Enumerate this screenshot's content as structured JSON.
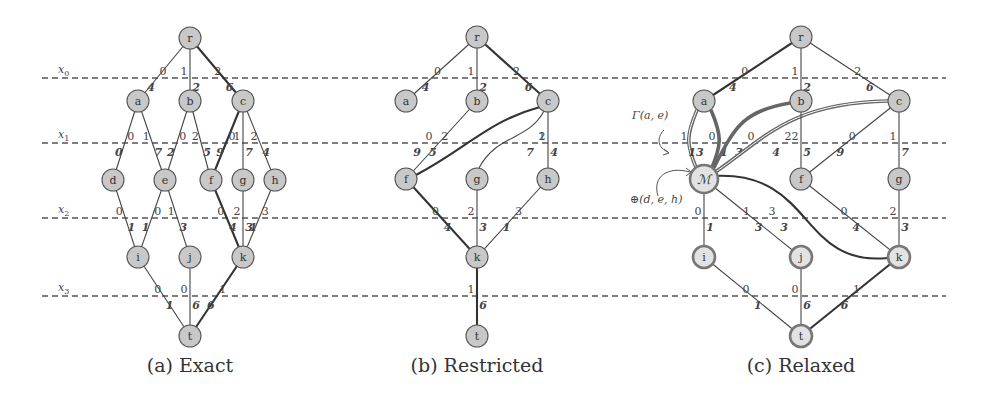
{
  "figure": {
    "layer_lines": {
      "x_start": 42,
      "x_end": 946,
      "rows": [
        {
          "label": "x0",
          "y": 78
        },
        {
          "label": "x1",
          "y": 143
        },
        {
          "label": "x2",
          "y": 218
        },
        {
          "label": "x3",
          "y": 296
        }
      ]
    },
    "node_radius": 11,
    "panels": [
      {
        "id": "a",
        "caption": "(a) Exact",
        "caption_x": 190,
        "nodes": [
          {
            "id": "r",
            "label": "r",
            "x": 190,
            "y": 38
          },
          {
            "id": "a",
            "label": "a",
            "x": 138,
            "y": 101
          },
          {
            "id": "b",
            "label": "b",
            "x": 190,
            "y": 101
          },
          {
            "id": "c",
            "label": "c",
            "x": 243,
            "y": 101
          },
          {
            "id": "d",
            "label": "d",
            "x": 113,
            "y": 180
          },
          {
            "id": "e",
            "label": "e",
            "x": 165,
            "y": 180
          },
          {
            "id": "f",
            "label": "f",
            "x": 211,
            "y": 180
          },
          {
            "id": "g",
            "label": "g",
            "x": 243,
            "y": 180
          },
          {
            "id": "h",
            "label": "h",
            "x": 275,
            "y": 180
          },
          {
            "id": "i",
            "label": "i",
            "x": 138,
            "y": 257
          },
          {
            "id": "j",
            "label": "j",
            "x": 190,
            "y": 257
          },
          {
            "id": "k",
            "label": "k",
            "x": 243,
            "y": 257
          },
          {
            "id": "t",
            "label": "t",
            "x": 190,
            "y": 336
          }
        ],
        "edges": [
          {
            "from": "r",
            "to": "a",
            "value": "0",
            "weight": "4",
            "style": "normal"
          },
          {
            "from": "r",
            "to": "b",
            "value": "1",
            "weight": "2",
            "style": "normal"
          },
          {
            "from": "r",
            "to": "c",
            "value": "2",
            "weight": "6",
            "style": "bold"
          },
          {
            "from": "a",
            "to": "d",
            "value": "0",
            "weight": "0",
            "style": "normal"
          },
          {
            "from": "a",
            "to": "e",
            "value": "1",
            "weight": "7",
            "style": "normal"
          },
          {
            "from": "b",
            "to": "e",
            "value": "0",
            "weight": "2",
            "style": "normal"
          },
          {
            "from": "b",
            "to": "f",
            "value": "2",
            "weight": "5",
            "style": "normal"
          },
          {
            "from": "c",
            "to": "f",
            "value": "0",
            "weight": "9",
            "style": "bold"
          },
          {
            "from": "c",
            "to": "g",
            "value": "1",
            "weight": "7",
            "style": "normal"
          },
          {
            "from": "c",
            "to": "h",
            "value": "2",
            "weight": "4",
            "style": "normal"
          },
          {
            "from": "d",
            "to": "i",
            "value": "0",
            "weight": "1",
            "style": "normal"
          },
          {
            "from": "e",
            "to": "i",
            "value": "0",
            "weight": "1",
            "style": "normal"
          },
          {
            "from": "e",
            "to": "j",
            "value": "1",
            "weight": "3",
            "style": "normal"
          },
          {
            "from": "f",
            "to": "k",
            "value": "0",
            "weight": "4",
            "style": "bold"
          },
          {
            "from": "g",
            "to": "k",
            "value": "2",
            "weight": "3",
            "style": "normal"
          },
          {
            "from": "h",
            "to": "k",
            "value": "3",
            "weight": "1",
            "style": "normal"
          },
          {
            "from": "i",
            "to": "t",
            "value": "0",
            "weight": "1",
            "style": "normal"
          },
          {
            "from": "j",
            "to": "t",
            "value": "0",
            "weight": "6",
            "style": "normal"
          },
          {
            "from": "k",
            "to": "t",
            "value": "1",
            "weight": "6",
            "style": "bold"
          }
        ]
      },
      {
        "id": "b",
        "caption": "(b) Restricted",
        "caption_x": 477,
        "nodes": [
          {
            "id": "r",
            "label": "r",
            "x": 477,
            "y": 37
          },
          {
            "id": "a",
            "label": "a",
            "x": 406,
            "y": 101
          },
          {
            "id": "b",
            "label": "b",
            "x": 477,
            "y": 101
          },
          {
            "id": "c",
            "label": "c",
            "x": 548,
            "y": 101
          },
          {
            "id": "f",
            "label": "f",
            "x": 406,
            "y": 179
          },
          {
            "id": "g",
            "label": "g",
            "x": 477,
            "y": 179
          },
          {
            "id": "h",
            "label": "h",
            "x": 548,
            "y": 179
          },
          {
            "id": "k",
            "label": "k",
            "x": 477,
            "y": 257
          },
          {
            "id": "t",
            "label": "t",
            "x": 477,
            "y": 336
          }
        ],
        "edges": [
          {
            "from": "r",
            "to": "a",
            "value": "0",
            "weight": "4",
            "style": "normal"
          },
          {
            "from": "r",
            "to": "b",
            "value": "1",
            "weight": "2",
            "style": "normal"
          },
          {
            "from": "r",
            "to": "c",
            "value": "2",
            "weight": "6",
            "style": "bold"
          },
          {
            "from": "b",
            "to": "f",
            "value": "2",
            "weight": "5",
            "style": "normal"
          },
          {
            "from": "c",
            "to": "f",
            "value": "0",
            "weight": "9",
            "style": "bold",
            "curve": "s"
          },
          {
            "from": "c",
            "to": "g",
            "value": "1",
            "weight": "7",
            "style": "normal",
            "curve": "s"
          },
          {
            "from": "c",
            "to": "h",
            "value": "2",
            "weight": "4",
            "style": "normal"
          },
          {
            "from": "f",
            "to": "k",
            "value": "0",
            "weight": "4",
            "style": "bold"
          },
          {
            "from": "g",
            "to": "k",
            "value": "2",
            "weight": "3",
            "style": "normal"
          },
          {
            "from": "h",
            "to": "k",
            "value": "3",
            "weight": "1",
            "style": "normal"
          },
          {
            "from": "k",
            "to": "t",
            "value": "1",
            "weight": "6",
            "style": "bold"
          }
        ]
      },
      {
        "id": "c",
        "caption": "(c) Relaxed",
        "caption_x": 801,
        "nodes": [
          {
            "id": "r",
            "label": "r",
            "x": 801,
            "y": 37
          },
          {
            "id": "a",
            "label": "a",
            "x": 704,
            "y": 101
          },
          {
            "id": "b",
            "label": "b",
            "x": 801,
            "y": 101
          },
          {
            "id": "c",
            "label": "c",
            "x": 899,
            "y": 101
          },
          {
            "id": "M",
            "label": "ℳ",
            "x": 704,
            "y": 179,
            "ring": true,
            "big": true
          },
          {
            "id": "f",
            "label": "f",
            "x": 801,
            "y": 179
          },
          {
            "id": "g",
            "label": "g",
            "x": 899,
            "y": 179
          },
          {
            "id": "i",
            "label": "i",
            "x": 704,
            "y": 257,
            "ring": true
          },
          {
            "id": "j",
            "label": "j",
            "x": 801,
            "y": 257,
            "ring": true
          },
          {
            "id": "k",
            "label": "k",
            "x": 899,
            "y": 257,
            "ring": true
          },
          {
            "id": "t",
            "label": "t",
            "x": 801,
            "y": 336,
            "ring": true
          }
        ],
        "edges": [
          {
            "from": "r",
            "to": "a",
            "value": "0",
            "weight": "4",
            "style": "bold"
          },
          {
            "from": "r",
            "to": "b",
            "value": "1",
            "weight": "2",
            "style": "normal"
          },
          {
            "from": "r",
            "to": "c",
            "value": "2",
            "weight": "6",
            "style": "normal"
          },
          {
            "from": "a",
            "to": "M",
            "value": "1",
            "weight": "13",
            "style": "double",
            "curve": "left"
          },
          {
            "from": "a",
            "to": "M",
            "value": "0",
            "weight": "1",
            "style": "ringedge",
            "curve": "right"
          },
          {
            "from": "b",
            "to": "M",
            "value": "0",
            "weight": "3",
            "style": "ringedge",
            "curve": "bm"
          },
          {
            "from": "c",
            "to": "M",
            "value": "2",
            "weight": "4",
            "style": "double",
            "curve": "cm"
          },
          {
            "from": "b",
            "to": "f",
            "value": "2",
            "weight": "5",
            "style": "normal"
          },
          {
            "from": "c",
            "to": "f",
            "value": "0",
            "weight": "9",
            "style": "normal"
          },
          {
            "from": "c",
            "to": "g",
            "value": "1",
            "weight": "7",
            "style": "normal"
          },
          {
            "from": "M",
            "to": "i",
            "value": "0",
            "weight": "1",
            "style": "normal"
          },
          {
            "from": "M",
            "to": "j",
            "value": "1",
            "weight": "3",
            "style": "normal"
          },
          {
            "from": "M",
            "to": "k",
            "value": "3",
            "weight": "3",
            "style": "bold",
            "curve": "mk"
          },
          {
            "from": "f",
            "to": "k",
            "value": "0",
            "weight": "4",
            "style": "normal"
          },
          {
            "from": "g",
            "to": "k",
            "value": "2",
            "weight": "3",
            "style": "normal"
          },
          {
            "from": "i",
            "to": "t",
            "value": "0",
            "weight": "1",
            "style": "normal"
          },
          {
            "from": "j",
            "to": "t",
            "value": "0",
            "weight": "6",
            "style": "normal"
          },
          {
            "from": "k",
            "to": "t",
            "value": "1",
            "weight": "6",
            "style": "bold"
          }
        ],
        "annotations": [
          {
            "id": "gamma",
            "text": "Γ(a, e)",
            "x": 632,
            "y": 119
          },
          {
            "id": "oplus",
            "text": "⊕(d, e, h)",
            "x": 630,
            "y": 203
          }
        ]
      }
    ]
  }
}
